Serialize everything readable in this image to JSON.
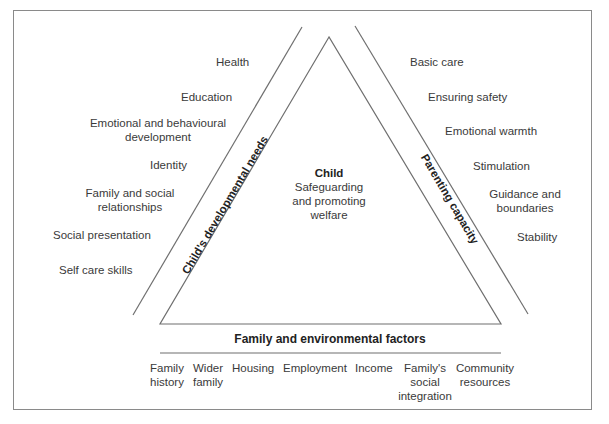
{
  "diagram": {
    "center": {
      "title": "Child",
      "lines": [
        "Safeguarding",
        "and promoting",
        "welfare"
      ]
    },
    "left_side": {
      "label": "Child's developmental needs",
      "items": [
        "Health",
        "Education",
        "Emotional and behavioural development",
        "Identity",
        "Family and social relationships",
        "Social presentation",
        "Self care skills"
      ],
      "display": {
        "health": "Health",
        "education": "Education",
        "emotional_1": "Emotional and behavioural",
        "emotional_2": "development",
        "identity": "Identity",
        "family_1": "Family and social",
        "family_2": "relationships",
        "social": "Social presentation",
        "selfcare": "Self care skills"
      }
    },
    "right_side": {
      "label": "Parenting capacity",
      "items": [
        "Basic care",
        "Ensuring safety",
        "Emotional warmth",
        "Stimulation",
        "Guidance and boundaries",
        "Stability"
      ],
      "display": {
        "basic": "Basic care",
        "safety": "Ensuring safety",
        "warmth": "Emotional warmth",
        "stim": "Stimulation",
        "guidance_1": "Guidance and",
        "guidance_2": "boundaries",
        "stability": "Stability"
      }
    },
    "bottom_side": {
      "label": "Family and environmental factors",
      "items": [
        {
          "l1": "Family",
          "l2": "history",
          "l3": ""
        },
        {
          "l1": "Wider",
          "l2": "family",
          "l3": ""
        },
        {
          "l1": "Housing",
          "l2": "",
          "l3": ""
        },
        {
          "l1": "Employment",
          "l2": "",
          "l3": ""
        },
        {
          "l1": "Income",
          "l2": "",
          "l3": ""
        },
        {
          "l1": "Family's",
          "l2": "social",
          "l3": "integration"
        },
        {
          "l1": "Community",
          "l2": "resources",
          "l3": ""
        }
      ]
    },
    "colors": {
      "line": "#6f6f6f",
      "frame": "#8a8a8a",
      "text": "#3a3a3a"
    }
  }
}
